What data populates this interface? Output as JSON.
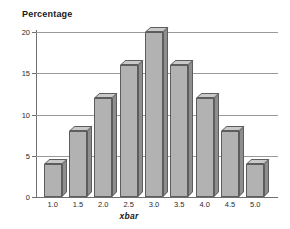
{
  "chart_data": {
    "type": "bar",
    "title": "Percentage",
    "xlabel": "xbar",
    "ylabel": "",
    "categories": [
      "1.0",
      "1.5",
      "2.0",
      "2.5",
      "3.0",
      "3.5",
      "4.0",
      "4.5",
      "5.0"
    ],
    "values": [
      4,
      8,
      12,
      16,
      20,
      16,
      12,
      8,
      4
    ],
    "ylim": [
      0,
      20
    ],
    "yticks": [
      "0",
      "5",
      "10",
      "15",
      "20"
    ],
    "ytick_values": [
      0,
      5,
      10,
      15,
      20
    ],
    "xticks": [
      "1.0",
      "1.5",
      "2.0",
      "2.5",
      "3.0",
      "3.5",
      "4.0",
      "4.5",
      "5.0"
    ],
    "grid": true,
    "legend": null,
    "style": "3d-bars",
    "colors": {
      "bar_face": "#b2b2b2",
      "bar_top": "#c9c9c9",
      "bar_side": "#8e8e8e",
      "bar_outline": "#5d5d5d",
      "gridline": "#9a9a9a",
      "axis": "#6f6f6f",
      "text": "#1a1a1a",
      "background": "#ffffff"
    }
  }
}
